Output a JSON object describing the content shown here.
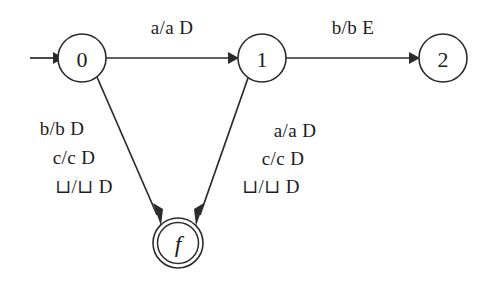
{
  "diagram": {
    "type": "finite-state-transducer",
    "title": "",
    "background_color": "#ffffff",
    "stroke_color": "#2b2b2b",
    "text_color": "#1c1c1c",
    "states": [
      {
        "id": "0",
        "label": "0",
        "kind": "start",
        "cx": 82,
        "cy": 58,
        "r": 24
      },
      {
        "id": "1",
        "label": "1",
        "kind": "normal",
        "cx": 262,
        "cy": 58,
        "r": 24
      },
      {
        "id": "2",
        "label": "2",
        "kind": "normal",
        "cx": 443,
        "cy": 58,
        "r": 24
      },
      {
        "id": "f",
        "label": "f",
        "kind": "accepting",
        "cx": 178,
        "cy": 243,
        "r": 25,
        "r_inner": 20.5
      }
    ],
    "start_arrow": {
      "from_x": 30,
      "to_x": 58,
      "y": 58
    },
    "transitions": [
      {
        "id": "t0-1",
        "from": "0",
        "to": "1",
        "label": "a/a D",
        "label_x": 172,
        "label_y": 27
      },
      {
        "id": "t1-2",
        "from": "1",
        "to": "2",
        "label": "b/b E",
        "label_x": 353,
        "label_y": 27
      },
      {
        "id": "t0-f",
        "from": "0",
        "to": "f",
        "label_lines": [
          "b/b D",
          "c/c D",
          "⊔/⊔ D"
        ],
        "label_x": 72,
        "label_y_start": 128,
        "label_line_height": 29
      },
      {
        "id": "t1-f",
        "from": "1",
        "to": "f",
        "label_lines": [
          "a/a D",
          "c/c D",
          "⊔/⊔ D"
        ],
        "label_x": 285,
        "label_y_start": 130,
        "label_line_height": 28
      }
    ]
  }
}
